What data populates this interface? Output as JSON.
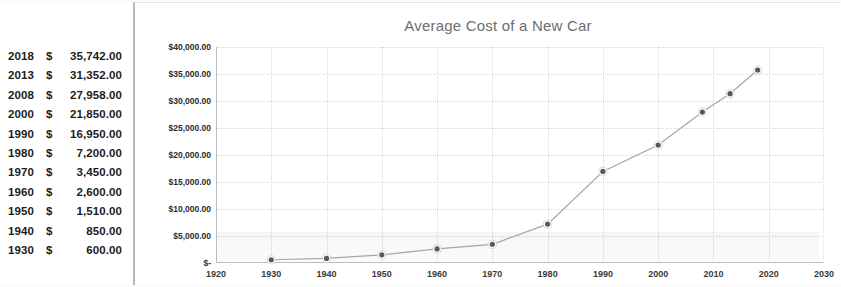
{
  "table": {
    "currency_symbol": "$",
    "rows": [
      {
        "year": "2018",
        "amount": "35,742.00"
      },
      {
        "year": "2013",
        "amount": "31,352.00"
      },
      {
        "year": "2008",
        "amount": "27,958.00"
      },
      {
        "year": "2000",
        "amount": "21,850.00"
      },
      {
        "year": "1990",
        "amount": "16,950.00"
      },
      {
        "year": "1980",
        "amount": "7,200.00"
      },
      {
        "year": "1970",
        "amount": "3,450.00"
      },
      {
        "year": "1960",
        "amount": "2,600.00"
      },
      {
        "year": "1950",
        "amount": "1,510.00"
      },
      {
        "year": "1940",
        "amount": "850.00"
      },
      {
        "year": "1930",
        "amount": "600.00"
      }
    ]
  },
  "chart": {
    "title": "Average Cost of a New Car",
    "title_color": "#6e6e6e",
    "marker_color": "#595959",
    "line_color": "#a6a6a6",
    "gridline_color": "#d8d8d8",
    "axis_color": "#bdbdbd"
  },
  "chart_data": {
    "type": "line",
    "title": "Average Cost of a New Car",
    "xlabel": "",
    "ylabel": "",
    "xlim": [
      1920,
      2030
    ],
    "ylim": [
      0,
      40000
    ],
    "grid": true,
    "legend": "none",
    "x": [
      1930,
      1940,
      1950,
      1960,
      1970,
      1980,
      1990,
      2000,
      2008,
      2013,
      2018
    ],
    "values": [
      600,
      850,
      1510,
      2600,
      3450,
      7200,
      16950,
      21850,
      27958,
      31352,
      35742
    ],
    "series": [
      {
        "name": "Average Cost of a New Car",
        "values": [
          600,
          850,
          1510,
          2600,
          3450,
          7200,
          16950,
          21850,
          27958,
          31352,
          35742
        ]
      }
    ],
    "x_tick_labels": [
      "1920",
      "1930",
      "1940",
      "1950",
      "1960",
      "1970",
      "1980",
      "1990",
      "2000",
      "2010",
      "2020",
      "2030"
    ],
    "x_tick_values": [
      1920,
      1930,
      1940,
      1950,
      1960,
      1970,
      1980,
      1990,
      2000,
      2010,
      2020,
      2030
    ],
    "y_tick_labels": [
      "$40,000.00",
      "$35,000.00",
      "$30,000.00",
      "$25,000.00",
      "$20,000.00",
      "$15,000.00",
      "$10,000.00",
      "$5,000.00",
      "$-"
    ],
    "y_tick_values": [
      40000,
      35000,
      30000,
      25000,
      20000,
      15000,
      10000,
      5000,
      0
    ]
  }
}
